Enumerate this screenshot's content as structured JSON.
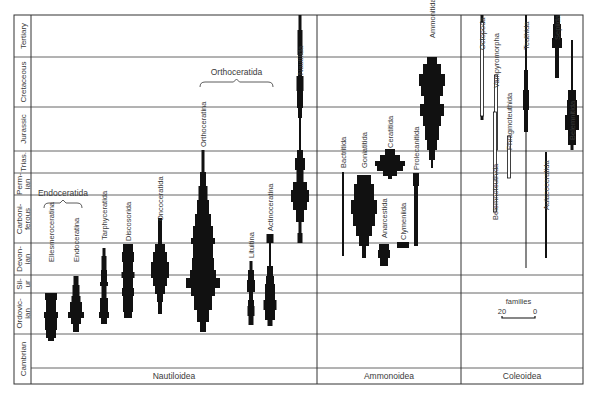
{
  "figure": {
    "frame": {
      "left": 14,
      "right": 583,
      "top": 15,
      "bottom": 384,
      "period_col_right": 31,
      "label_band_top": 368
    },
    "colors": {
      "ink": "#111111",
      "grid": "#555555",
      "text": "#3a3a3a",
      "background": "#ffffff"
    },
    "periods": [
      {
        "name": "Tertiary",
        "top": 15,
        "bottom": 57
      },
      {
        "name": "Cretaceous",
        "top": 57,
        "bottom": 107
      },
      {
        "name": "Jurassic",
        "top": 107,
        "bottom": 151
      },
      {
        "name": "Trias.",
        "top": 151,
        "bottom": 173
      },
      {
        "name": "Perm-ian",
        "top": 173,
        "bottom": 195
      },
      {
        "name": "Carboni-ferous",
        "top": 195,
        "bottom": 243
      },
      {
        "name": "Devon-ian",
        "top": 243,
        "bottom": 275
      },
      {
        "name": "Sil-ur",
        "top": 275,
        "bottom": 293
      },
      {
        "name": "Ordovic-ian",
        "top": 293,
        "bottom": 334
      },
      {
        "name": "Cambrian",
        "top": 334,
        "bottom": 384
      }
    ],
    "groups": [
      {
        "name": "Nautiloidea",
        "x0": 31,
        "x1": 317
      },
      {
        "name": "Ammonoidea",
        "x0": 317,
        "x1": 461
      },
      {
        "name": "Coleoidea",
        "x0": 461,
        "x1": 583
      }
    ],
    "brackets": [
      {
        "label": "Endoceratida",
        "x0": 44,
        "x1": 82,
        "y": 203
      },
      {
        "label": "Orthoceratida",
        "x0": 200,
        "x1": 273,
        "y": 82
      }
    ],
    "scale": {
      "title": "families",
      "left_label": "20",
      "right_label": "0",
      "x0": 502,
      "x1": 535,
      "y": 318
    }
  },
  "chart_data": {
    "type": "spindle-diagram",
    "title": "",
    "subtitle": "",
    "xlabel": "",
    "ylabel": "Geological period",
    "y_categories": [
      "Cambrian",
      "Ordovician",
      "Silurian",
      "Devonian",
      "Carboniferous",
      "Permian",
      "Triassic",
      "Jurassic",
      "Cretaceous",
      "Tertiary"
    ],
    "width_unit": "families (scale bar 20 → 0)",
    "groups": [
      "Nautiloidea",
      "Ammonoidea",
      "Coleoidea"
    ],
    "taxa": [
      {
        "name": "Ellesmeroceratina",
        "group": "Nautiloidea",
        "x": 51,
        "label_y": 262,
        "segments": [
          [
            293,
            300,
            12
          ],
          [
            300,
            312,
            10
          ],
          [
            312,
            318,
            14
          ],
          [
            318,
            330,
            12
          ],
          [
            330,
            338,
            10
          ],
          [
            338,
            341,
            6
          ]
        ]
      },
      {
        "name": "Endoceratina",
        "group": "Nautiloidea",
        "x": 76,
        "label_y": 262,
        "segments": [
          [
            276,
            285,
            5
          ],
          [
            285,
            296,
            7
          ],
          [
            296,
            302,
            9
          ],
          [
            302,
            312,
            12
          ],
          [
            312,
            318,
            16
          ],
          [
            318,
            324,
            10
          ],
          [
            324,
            332,
            6
          ]
        ]
      },
      {
        "name": "Tarphyceratida",
        "group": "Nautiloidea",
        "x": 104,
        "label_y": 240,
        "segments": [
          [
            248,
            256,
            3
          ],
          [
            256,
            270,
            5
          ],
          [
            270,
            282,
            6
          ],
          [
            282,
            286,
            8
          ],
          [
            286,
            298,
            5
          ],
          [
            298,
            312,
            8
          ],
          [
            312,
            318,
            10
          ],
          [
            318,
            324,
            6
          ]
        ]
      },
      {
        "name": "Discosorida",
        "group": "Nautiloidea",
        "x": 128,
        "label_y": 241,
        "segments": [
          [
            244,
            252,
            10
          ],
          [
            252,
            262,
            12
          ],
          [
            262,
            272,
            10
          ],
          [
            272,
            278,
            13
          ],
          [
            278,
            288,
            10
          ],
          [
            288,
            296,
            12
          ],
          [
            296,
            312,
            10
          ],
          [
            312,
            318,
            8
          ]
        ]
      },
      {
        "name": "Oncoceratida",
        "group": "Nautiloidea",
        "x": 160,
        "label_y": 221,
        "segments": [
          [
            218,
            244,
            4
          ],
          [
            244,
            252,
            10
          ],
          [
            252,
            262,
            14
          ],
          [
            262,
            278,
            18
          ],
          [
            278,
            286,
            14
          ],
          [
            286,
            294,
            10
          ],
          [
            294,
            302,
            6
          ],
          [
            302,
            314,
            4
          ]
        ]
      },
      {
        "name": "Orthoceratina",
        "group": "Nautiloidea",
        "x": 203,
        "label_y": 147,
        "segments": [
          [
            150,
            172,
            3
          ],
          [
            172,
            186,
            6
          ],
          [
            186,
            200,
            9
          ],
          [
            200,
            214,
            12
          ],
          [
            214,
            226,
            16
          ],
          [
            226,
            238,
            20
          ],
          [
            238,
            244,
            24
          ],
          [
            244,
            258,
            20
          ],
          [
            258,
            270,
            22
          ],
          [
            270,
            278,
            26
          ],
          [
            278,
            288,
            34
          ],
          [
            288,
            296,
            24
          ],
          [
            296,
            310,
            18
          ],
          [
            310,
            322,
            12
          ],
          [
            322,
            332,
            6
          ]
        ]
      },
      {
        "name": "Lituitina",
        "group": "Nautiloidea",
        "x": 251,
        "label_y": 258,
        "segments": [
          [
            261,
            270,
            3
          ],
          [
            270,
            280,
            6
          ],
          [
            280,
            292,
            8
          ],
          [
            292,
            300,
            4
          ],
          [
            300,
            306,
            6
          ],
          [
            306,
            316,
            7
          ],
          [
            316,
            325,
            5
          ]
        ]
      },
      {
        "name": "Actinoceratina",
        "group": "Nautiloidea",
        "x": 270,
        "label_y": 231,
        "segments": [
          [
            234,
            243,
            7
          ],
          [
            243,
            266,
            2
          ],
          [
            266,
            276,
            6
          ],
          [
            276,
            284,
            8
          ],
          [
            284,
            300,
            10
          ],
          [
            300,
            310,
            13
          ],
          [
            310,
            320,
            10
          ],
          [
            320,
            326,
            5
          ]
        ]
      },
      {
        "name": "Nautilida",
        "group": "Nautiloidea",
        "x": 300,
        "label_y": 75,
        "segments": [
          [
            15,
            30,
            3
          ],
          [
            30,
            55,
            5
          ],
          [
            55,
            76,
            4
          ],
          [
            76,
            91,
            7
          ],
          [
            91,
            108,
            6
          ],
          [
            108,
            118,
            4
          ],
          [
            118,
            150,
            2
          ],
          [
            150,
            158,
            6
          ],
          [
            158,
            170,
            10
          ],
          [
            170,
            182,
            7
          ],
          [
            182,
            190,
            14
          ],
          [
            190,
            202,
            18
          ],
          [
            202,
            210,
            14
          ],
          [
            210,
            222,
            8
          ],
          [
            222,
            233,
            3
          ],
          [
            233,
            243,
            5
          ]
        ]
      },
      {
        "name": "Bactritida",
        "group": "Ammonoidea",
        "x": 343,
        "label_y": 168,
        "segments": [
          [
            172,
            256,
            2
          ]
        ]
      },
      {
        "name": "Goniatitida",
        "group": "Ammonoidea",
        "x": 364,
        "label_y": 168,
        "segments": [
          [
            175,
            184,
            14
          ],
          [
            184,
            200,
            20
          ],
          [
            200,
            214,
            26
          ],
          [
            214,
            226,
            22
          ],
          [
            226,
            236,
            16
          ],
          [
            236,
            246,
            10
          ],
          [
            246,
            258,
            4
          ]
        ]
      },
      {
        "name": "Ceratitida",
        "group": "Ammonoidea",
        "x": 390,
        "label_y": 148,
        "segments": [
          [
            149,
            155,
            10
          ],
          [
            155,
            161,
            20
          ],
          [
            161,
            166,
            30
          ],
          [
            166,
            171,
            26
          ],
          [
            171,
            176,
            14
          ],
          [
            176,
            179,
            4
          ]
        ]
      },
      {
        "name": "Prolecanitida",
        "group": "Ammonoidea",
        "x": 416,
        "label_y": 170,
        "segments": [
          [
            173,
            186,
            6
          ],
          [
            186,
            246,
            4
          ]
        ]
      },
      {
        "name": "Anarcestida",
        "group": "Ammonoidea",
        "x": 384,
        "label_y": 238,
        "segments": [
          [
            244,
            250,
            10
          ],
          [
            250,
            258,
            12
          ],
          [
            258,
            266,
            8
          ]
        ]
      },
      {
        "name": "Clymeniida",
        "group": "Ammonoidea",
        "x": 403,
        "label_y": 240,
        "segments": [
          [
            242,
            248,
            12
          ]
        ]
      },
      {
        "name": "Ammonitida",
        "group": "Ammonoidea",
        "x": 432,
        "label_y": 38,
        "segments": [
          [
            57,
            64,
            10
          ],
          [
            64,
            74,
            18
          ],
          [
            74,
            86,
            26
          ],
          [
            86,
            96,
            22
          ],
          [
            96,
            104,
            16
          ],
          [
            104,
            116,
            24
          ],
          [
            116,
            126,
            18
          ],
          [
            126,
            140,
            14
          ],
          [
            140,
            150,
            10
          ],
          [
            150,
            160,
            6
          ],
          [
            160,
            168,
            2
          ]
        ]
      },
      {
        "name": "Octopoda",
        "group": "Coleoidea",
        "x": 482,
        "label_y": 50,
        "segments": [
          [
            15,
            22,
            3
          ],
          [
            22,
            116,
            1
          ],
          [
            116,
            120,
            3
          ]
        ],
        "hollow": true
      },
      {
        "name": "Vampyromorpha",
        "group": "Coleoidea",
        "x": 496,
        "label_y": 88,
        "segments": [
          [
            75,
            150,
            2
          ]
        ],
        "hollow": true
      },
      {
        "name": "Belemnoteuthida",
        "group": "Coleoidea",
        "x": 495,
        "label_y": 220,
        "segments": [
          [
            112,
            212,
            2
          ]
        ],
        "hollow": true
      },
      {
        "name": "Phragmoteuthida",
        "group": "Coleoidea",
        "x": 509,
        "label_y": 150,
        "segments": [
          [
            136,
            178,
            2
          ]
        ],
        "hollow": true
      },
      {
        "name": "Teuthida",
        "group": "Coleoidea",
        "x": 526,
        "label_y": 50,
        "segments": [
          [
            15,
            70,
            2
          ],
          [
            70,
            90,
            4
          ],
          [
            90,
            110,
            6
          ],
          [
            110,
            132,
            4
          ],
          [
            132,
            268,
            1
          ]
        ]
      },
      {
        "name": "Aulacoceratida",
        "group": "Coleoidea",
        "x": 546,
        "label_y": 210,
        "segments": [
          [
            152,
            258,
            2
          ]
        ]
      },
      {
        "name": "Sepiida",
        "group": "Coleoidea",
        "x": 557,
        "label_y": 40,
        "segments": [
          [
            15,
            24,
            6
          ],
          [
            24,
            38,
            8
          ],
          [
            38,
            48,
            10
          ],
          [
            48,
            78,
            4
          ]
        ]
      },
      {
        "name": "Belemnitida",
        "group": "Coleoidea",
        "x": 572,
        "label_y": 140,
        "segments": [
          [
            40,
            90,
            2
          ],
          [
            90,
            100,
            8
          ],
          [
            100,
            115,
            10
          ],
          [
            115,
            130,
            14
          ],
          [
            130,
            145,
            8
          ],
          [
            145,
            150,
            3
          ]
        ]
      }
    ],
    "annotations": [
      "Endoceratida",
      "Orthoceratida",
      "families 20 — 0"
    ],
    "legend": {
      "position": "inside, Coleoidea / Ordovician band",
      "entries": [
        "families scale 20 to 0"
      ]
    }
  }
}
